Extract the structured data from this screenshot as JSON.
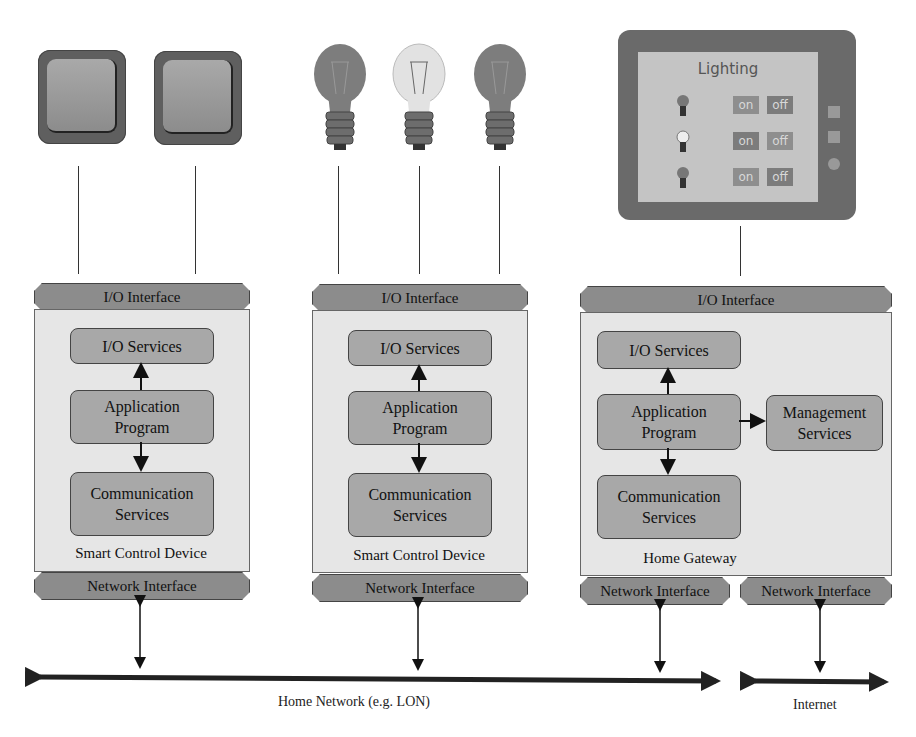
{
  "diagram": {
    "switches": [
      {
        "name": "switch-1"
      },
      {
        "name": "switch-2"
      }
    ],
    "bulbs": [
      {
        "name": "bulb-1",
        "state": "off"
      },
      {
        "name": "bulb-2",
        "state": "on"
      },
      {
        "name": "bulb-3",
        "state": "off"
      }
    ],
    "tablet": {
      "title": "Lighting",
      "rows": [
        {
          "bulb_state": "off",
          "on_label": "on",
          "off_label": "off"
        },
        {
          "bulb_state": "on",
          "on_label": "on",
          "off_label": "off"
        },
        {
          "bulb_state": "off",
          "on_label": "on",
          "off_label": "off"
        }
      ]
    },
    "devices": [
      {
        "io_interface": "I/O Interface",
        "io_services": "I/O Services",
        "application_program": "Application\nProgram",
        "communication_services": "Communication\nServices",
        "label": "Smart Control Device",
        "network_interface": "Network Interface"
      },
      {
        "io_interface": "I/O Interface",
        "io_services": "I/O Services",
        "application_program": "Application\nProgram",
        "communication_services": "Communication\nServices",
        "label": "Smart Control Device",
        "network_interface": "Network Interface"
      },
      {
        "io_interface": "I/O Interface",
        "io_services": "I/O Services",
        "application_program": "Application\nProgram",
        "management_services": "Management\nServices",
        "communication_services": "Communication\nServices",
        "label": "Home Gateway",
        "network_interface_1": "Network Interface",
        "network_interface_2": "Network Interface"
      }
    ],
    "networks": {
      "home": "Home Network (e.g. LON)",
      "internet": "Internet"
    },
    "colors": {
      "box_fill": "#a8a8a8",
      "interface_fill": "#8c8c8c",
      "device_fill": "#e6e6e6",
      "tablet_frame": "#6a6a6a",
      "tablet_screen": "#c4c4c4"
    }
  }
}
